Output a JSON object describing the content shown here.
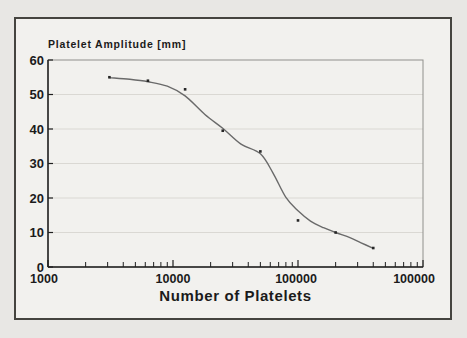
{
  "chart_data": {
    "type": "scatter",
    "title": "Platelet Amplitude [mm]",
    "xlabel": "Number of Platelets",
    "x_scale": "log",
    "x_min": 1000,
    "x_max": 1000000,
    "x_major_ticks": [
      1000,
      10000,
      100000,
      1000000
    ],
    "x_tick_labels": [
      "1000",
      "10000",
      "100000",
      "100000"
    ],
    "y_min": 0,
    "y_max": 60,
    "y_ticks": [
      0,
      10,
      20,
      30,
      40,
      50,
      60
    ],
    "y_tick_labels": [
      "0",
      "10",
      "20",
      "30",
      "40",
      "50",
      "60"
    ],
    "y_gridlines": [
      10,
      20,
      30,
      40,
      50
    ],
    "grid": "horizontal-only",
    "legend": "none",
    "points": [
      [
        3100,
        55
      ],
      [
        6300,
        54
      ],
      [
        12500,
        51.5
      ],
      [
        25000,
        39.5
      ],
      [
        50000,
        33.5
      ],
      [
        100000,
        13.5
      ],
      [
        200000,
        10
      ],
      [
        400000,
        5.5
      ]
    ],
    "fit_curve": [
      [
        3100,
        54.9
      ],
      [
        4500,
        54.4
      ],
      [
        6300,
        53.7
      ],
      [
        9000,
        52.4
      ],
      [
        12500,
        49.6
      ],
      [
        18000,
        44.2
      ],
      [
        25000,
        40.2
      ],
      [
        35000,
        35.6
      ],
      [
        50000,
        32.8
      ],
      [
        63000,
        27.3
      ],
      [
        80000,
        20.2
      ],
      [
        100000,
        16.3
      ],
      [
        126000,
        13.3
      ],
      [
        160000,
        11.4
      ],
      [
        200000,
        10.0
      ],
      [
        260000,
        8.5
      ],
      [
        320000,
        7.0
      ],
      [
        400000,
        5.4
      ]
    ],
    "colors": {
      "curve": "#6a6a6a",
      "point": "#262626",
      "grid": "#dad8d3",
      "axis": "#1f1f1f",
      "box": "#90908c",
      "text": "#1b1b1b",
      "frame_border": "#45443f",
      "paper": "#f2f1ee",
      "page_background": "#e8e7e4"
    }
  }
}
